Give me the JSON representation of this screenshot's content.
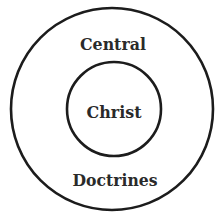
{
  "diagram": {
    "type": "concentric-circles",
    "outer_circle": {
      "label_top": "Central",
      "label_bottom": "Doctrines"
    },
    "inner_circle": {
      "label": "Christ"
    },
    "colors": {
      "stroke": "#1c1c1c",
      "text": "#2a2a2a",
      "background": "#ffffff"
    }
  }
}
